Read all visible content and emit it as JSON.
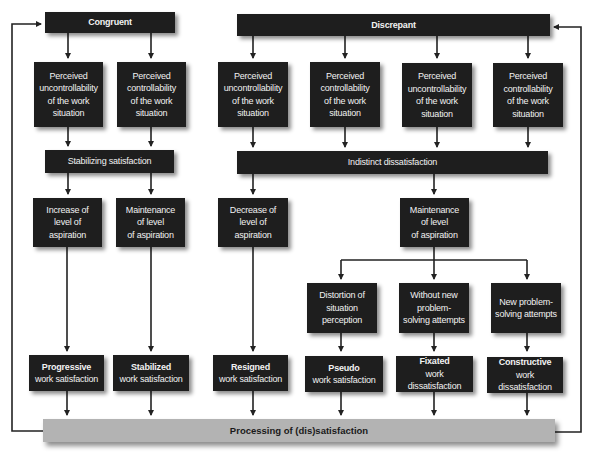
{
  "top": {
    "congruent": "Congruent",
    "discrepant": "Discrepant"
  },
  "perception": [
    {
      "label": "Perceived\nuncontrollability\nof the work\nsituation"
    },
    {
      "label": "Perceived\ncontrollability\nof the work\nsituation"
    },
    {
      "label": "Perceived\nuncontrollability\nof the work\nsituation"
    },
    {
      "label": "Perceived\ncontrollability\nof the work\nsituation"
    },
    {
      "label": "Perceived\nuncontrollability\nof the work\nsituation"
    },
    {
      "label": "Perceived\ncontrollability\nof the work\nsituation"
    }
  ],
  "middle": {
    "stabilizing": "Stabilizing satisfaction",
    "indistinct": "Indistinct dissatisfaction"
  },
  "aspiration": [
    {
      "label": "Increase of\nlevel of\naspiration"
    },
    {
      "label": "Maintenance\nof level\nof aspiration"
    },
    {
      "label": "Decrease of\nlevel of\naspiration"
    },
    {
      "label": "Maintenance\nof level\nof aspiration"
    }
  ],
  "coping": [
    {
      "label": "Distortion of\nsituation\nperception"
    },
    {
      "label": "Without new\nproblem-\nsolving attempts"
    },
    {
      "label": "New problem-\nsolving attempts"
    }
  ],
  "outcomes": [
    {
      "type": "Progressive",
      "desc": "work satisfaction"
    },
    {
      "type": "Stabilized",
      "desc": "work satisfaction"
    },
    {
      "type": "Resigned",
      "desc": "work satisfaction"
    },
    {
      "type": "Pseudo",
      "desc": "work satisfaction"
    },
    {
      "type": "Fixated",
      "desc": "work dissatisfaction"
    },
    {
      "type": "Constructive",
      "desc": "work dissatisfaction"
    }
  ],
  "processing": "Processing of (dis)satisfaction",
  "colors": {
    "box": "#1e1e1e",
    "box_text": "#f2f2f2",
    "processing_bar": "#b3b3b3",
    "line": "#222222"
  }
}
